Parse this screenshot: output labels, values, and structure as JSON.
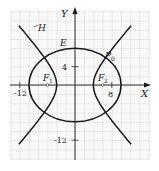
{
  "figure": {
    "axes": {
      "x_label": "X",
      "y_label": "Y"
    },
    "ticks": {
      "x_neg": "-12",
      "x_pos": "8",
      "y_pos": "4",
      "y_neg": "-12"
    },
    "curves": {
      "ellipse": {
        "label": "E",
        "equation": "x^2/100 + y^2/64 = 1"
      },
      "hyperbola": {
        "label": "H",
        "equation": "x^2/16 - y^2/20 = 1"
      }
    },
    "points": {
      "focus_left": {
        "label": "F",
        "sub": "1",
        "x": -6,
        "y": 0
      },
      "focus_right": {
        "label": "F",
        "sub": "2",
        "x": 6,
        "y": 0
      },
      "intersection": {
        "label": "P",
        "sub": "0"
      }
    },
    "colors": {
      "curve": "#1a1a1a",
      "grid_minor": "#d4d4d4",
      "grid_major": "#b0b0b0",
      "axis": "#1a1a1a"
    }
  }
}
